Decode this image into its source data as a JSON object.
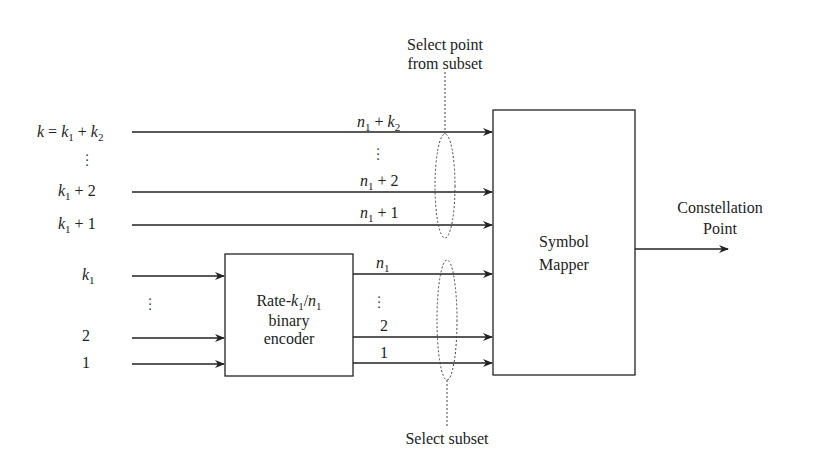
{
  "diagram": {
    "type": "block-diagram",
    "uncoded_inputs": [
      {
        "id": "k",
        "label": "k = k1 + k2",
        "output_label": "n1 + k2"
      },
      {
        "id": "ellipsis_top",
        "label": "⋮",
        "output_label": "⋮"
      },
      {
        "id": "k1p2",
        "label": "k1 + 2",
        "output_label": "n1 + 2"
      },
      {
        "id": "k1p1",
        "label": "k1 + 1",
        "output_label": "n1 + 1"
      }
    ],
    "coded_inputs": [
      {
        "id": "k1",
        "label": "k1",
        "output_label": "n1"
      },
      {
        "id": "ellipsis_bottom",
        "label": "⋮",
        "output_label": "⋮"
      },
      {
        "id": "in2",
        "label": "2",
        "output_label": "2"
      },
      {
        "id": "in1",
        "label": "1",
        "output_label": "1"
      }
    ],
    "encoder": {
      "line1": "Rate-k1/n1",
      "line2": "binary",
      "line3": "encoder"
    },
    "mapper": {
      "line1": "Symbol",
      "line2": "Mapper"
    },
    "output": {
      "line1": "Constellation",
      "line2": "Point"
    },
    "annotations": {
      "top_line1": "Select point",
      "top_line2": "from subset",
      "bottom": "Select subset"
    },
    "colors": {
      "line": "#222222",
      "background": "#ffffff"
    }
  }
}
